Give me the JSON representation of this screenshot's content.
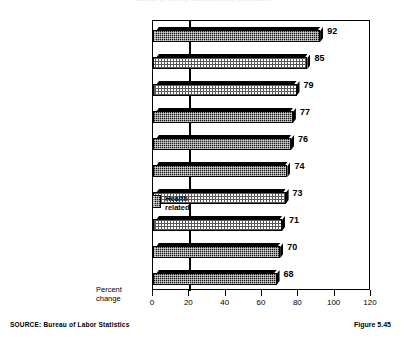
{
  "figure": {
    "source_note": "SOURCE:  Bureau of Labor Statistics",
    "figure_number": "Figure 5.45",
    "title_cutoff": "Fastest growing occupations, projected"
  },
  "legend": {
    "label": "Health\nrelated",
    "swatch_name": "health-related-swatch"
  },
  "chart_data": {
    "type": "bar",
    "orientation": "horizontal",
    "title": "",
    "xlabel": "Percent\nchange",
    "ylabel": "",
    "xlim": [
      0,
      120
    ],
    "xticks": [
      0,
      20,
      40,
      60,
      80,
      100,
      120
    ],
    "xtick_labels": [
      "0",
      "20",
      "40",
      "60",
      "80",
      "100",
      "120"
    ],
    "grid": "single vertical gridline at x=20",
    "legend_position": "inside-right-middle",
    "categories": [
      "Home health aides",
      "Paralegals",
      "Computer systems analysts",
      "Personal and home care aides",
      "Physical therapists",
      "Medical assistants",
      "Operations research analysts",
      "Human services workers",
      "Radiologic technologists",
      "Medical secretaries"
    ],
    "values": [
      92,
      85,
      79,
      77,
      76,
      74,
      73,
      71,
      70,
      68
    ],
    "value_labels": [
      "92",
      "85",
      "79",
      "77",
      "76",
      "74",
      "73",
      "71",
      "70",
      "68"
    ],
    "fills": [
      "dark",
      "light",
      "light",
      "dark",
      "dark",
      "dark",
      "light",
      "light",
      "dark",
      "dark"
    ],
    "health_related": [
      true,
      false,
      false,
      true,
      true,
      true,
      false,
      false,
      true,
      true
    ],
    "colors": {
      "dark_fill": "#1a1a1a",
      "light_fill": "#ffffff",
      "light_hatch": "#5a5a5a",
      "outline": "#000000",
      "background": "#ffffff"
    }
  }
}
